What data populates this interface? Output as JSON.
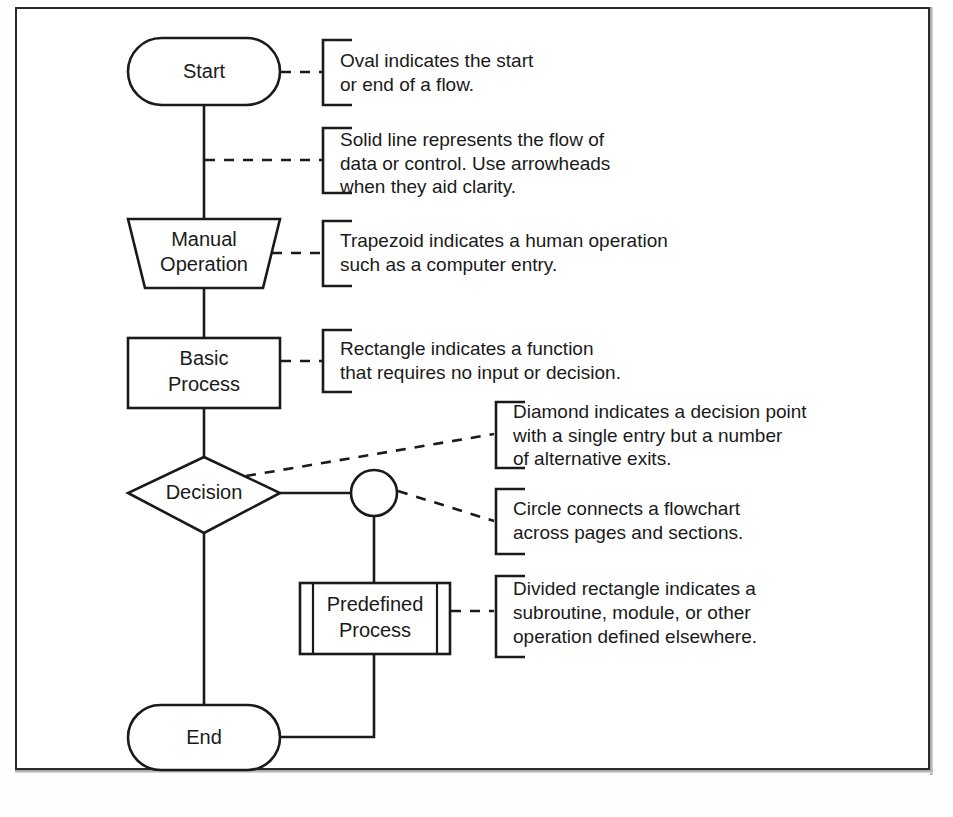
{
  "diagram": {
    "colors": {
      "stroke": "#1a1a1a",
      "background": "#ffffff",
      "frame": "#2b2b2b"
    },
    "nodes": [
      {
        "id": "start",
        "shape": "oval",
        "label": "Start"
      },
      {
        "id": "manual-operation",
        "shape": "trapezoid",
        "label_line1": "Manual",
        "label_line2": "Operation"
      },
      {
        "id": "basic-process",
        "shape": "rectangle",
        "label_line1": "Basic",
        "label_line2": "Process"
      },
      {
        "id": "decision",
        "shape": "diamond",
        "label": "Decision"
      },
      {
        "id": "connector",
        "shape": "circle",
        "label": ""
      },
      {
        "id": "predefined-process",
        "shape": "divided-rectangle",
        "label_line1": "Predefined",
        "label_line2": "Process"
      },
      {
        "id": "end",
        "shape": "oval",
        "label": "End"
      }
    ],
    "callouts": [
      {
        "id": "oval-callout",
        "target": "start",
        "lines": [
          "Oval indicates the start",
          "or end of a flow."
        ]
      },
      {
        "id": "line-callout",
        "target": "flow-line",
        "lines": [
          "Solid line represents the flow of",
          "data or control. Use arrowheads",
          "when they aid clarity."
        ]
      },
      {
        "id": "trapezoid-callout",
        "target": "manual-operation",
        "lines": [
          "Trapezoid indicates a human operation",
          "such as a computer entry."
        ]
      },
      {
        "id": "rectangle-callout",
        "target": "basic-process",
        "lines": [
          "Rectangle indicates a function",
          "that requires no input or decision."
        ]
      },
      {
        "id": "diamond-callout",
        "target": "decision",
        "lines": [
          "Diamond indicates a decision point",
          "with a single entry but a number",
          "of alternative exits."
        ]
      },
      {
        "id": "circle-callout",
        "target": "connector",
        "lines": [
          "Circle connects a flowchart",
          "across pages and sections."
        ]
      },
      {
        "id": "divided-rectangle-callout",
        "target": "predefined-process",
        "lines": [
          "Divided rectangle indicates a",
          "subroutine, module, or other",
          "operation defined elsewhere."
        ]
      }
    ]
  }
}
